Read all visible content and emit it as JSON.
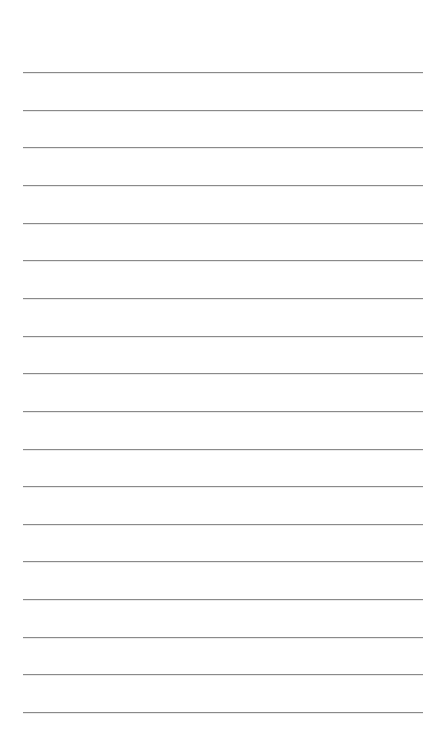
{
  "page": {
    "type": "lined-paper",
    "background_color": "#ffffff",
    "rule_color": "#8a8a8a",
    "rule_count": 18,
    "rule_left": 23,
    "rule_width": 400,
    "rule_first_y": 72,
    "rule_spacing": 37.65,
    "text_lines": [
      "",
      "",
      "",
      "",
      "",
      "",
      "",
      "",
      "",
      "",
      "",
      "",
      "",
      "",
      "",
      "",
      "",
      ""
    ]
  }
}
